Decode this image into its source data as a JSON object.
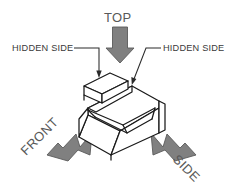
{
  "diagram": {
    "type": "isometric-technical-drawing",
    "background_color": "#ffffff",
    "object_line_color": "#1a1a1a",
    "arrow_fill_color": "#808080",
    "arrow_stroke_color": "#5a5a5a",
    "label_text_color": "#3a3a3a",
    "view_text_color": "#595959"
  },
  "view_labels": {
    "top": "TOP",
    "front": "FRONT",
    "side": "SIDE"
  },
  "callouts": {
    "left": "HIDDEN SIDE",
    "right": "HIDDEN SIDE"
  },
  "arrows": {
    "top_direction": "down",
    "front_direction": "up-right",
    "side_direction": "up-left"
  }
}
